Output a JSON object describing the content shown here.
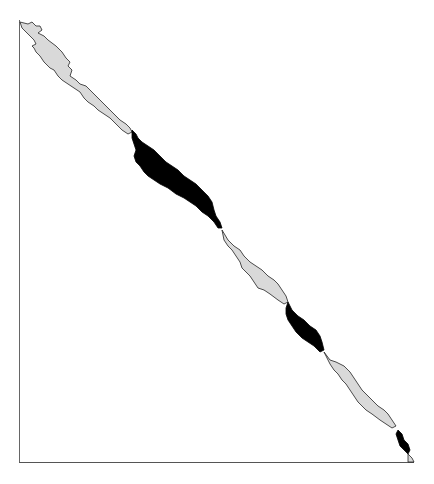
{
  "figure": {
    "type": "triangular contact-map diagonal band",
    "axes": {
      "left_line": true,
      "bottom_line": true
    },
    "colors": {
      "background": "#ffffff",
      "light_region": "#d9d9d9",
      "dark_region": "#000000",
      "outline": "#222222",
      "axis": "#555555"
    },
    "regions": [
      {
        "shade": "light",
        "label": ""
      },
      {
        "shade": "dark",
        "label": ""
      },
      {
        "shade": "light",
        "label": ""
      },
      {
        "shade": "dark",
        "label": ""
      },
      {
        "shade": "light",
        "label": ""
      },
      {
        "shade": "dark",
        "label": ""
      }
    ]
  }
}
